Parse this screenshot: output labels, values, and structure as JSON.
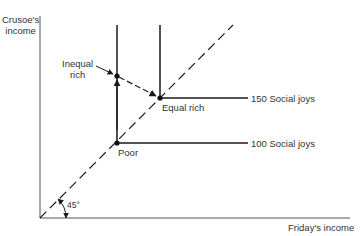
{
  "axes": {
    "y_label_line1": "Crusoe's",
    "y_label_line2": "income",
    "x_label": "Friday's income",
    "angle_label": "45°"
  },
  "points": {
    "poor": "Poor",
    "equal_rich": "Equal rich",
    "inequal_rich_line1": "Inequal",
    "inequal_rich_line2": "rich"
  },
  "indifference_curves": [
    {
      "label": "150 Social joys"
    },
    {
      "label": "100 Social joys"
    }
  ],
  "colors": {
    "line": "#1a1a1a",
    "text": "#333333"
  }
}
